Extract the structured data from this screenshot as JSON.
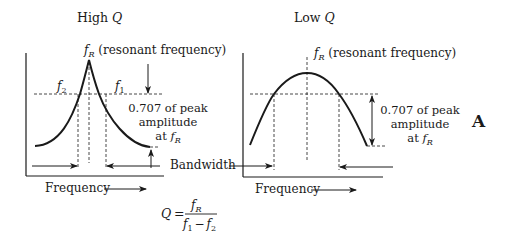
{
  "figure_label": "A",
  "panels": [
    {
      "id": "high-q",
      "title_prefix": "High ",
      "title_var": "Q",
      "peak_label_var": "f",
      "peak_label_sub": "R",
      "peak_label_text": " (resonant frequency)",
      "f2_var": "f",
      "f2_sub": "2",
      "f1_var": "f",
      "f1_sub": "1",
      "amplitude_line1": "0.707 of peak",
      "amplitude_line2": "amplitude",
      "amplitude_line3_prefix": "at ",
      "amplitude_line3_var": "f",
      "amplitude_line3_sub": "R",
      "bandwidth_label": "Bandwidth",
      "x_axis_label": "Frequency"
    },
    {
      "id": "low-q",
      "title_prefix": "Low ",
      "title_var": "Q",
      "peak_label_var": "f",
      "peak_label_sub": "R",
      "peak_label_text": " (resonant frequency)",
      "amplitude_line1": "0.707 of peak",
      "amplitude_line2": "amplitude",
      "amplitude_line3_prefix": "at ",
      "amplitude_line3_var": "f",
      "amplitude_line3_sub": "R",
      "x_axis_label": "Frequency"
    }
  ],
  "formula": {
    "lhs": "Q",
    "equals": "=",
    "numerator_var": "f",
    "numerator_sub": "R",
    "denominator_a_var": "f",
    "denominator_a_sub": "1",
    "minus": "−",
    "denominator_b_var": "f",
    "denominator_b_sub": "2"
  },
  "colors": {
    "ink": "#1a1a1a",
    "background": "#ffffff"
  }
}
